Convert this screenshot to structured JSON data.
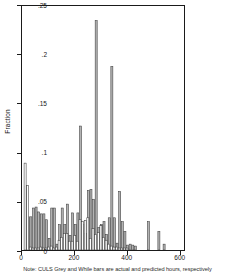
{
  "chart_data": {
    "type": "bar",
    "title": "",
    "subtitle": "",
    "xlabel": "",
    "ylabel": "Fraction",
    "xlim": [
      0,
      620
    ],
    "ylim": [
      0,
      0.25
    ],
    "grid": false,
    "legend_position": "none",
    "note": "Note: CULS Grey and While bars are actual  and predicted hours, respectively",
    "xticks": [
      0,
      200,
      400,
      600
    ],
    "xtick_labels": [
      "0",
      "200",
      "400",
      "600"
    ],
    "yticks": [
      0,
      0.05,
      0.1,
      0.15,
      0.2,
      0.25
    ],
    "ytick_labels": [
      "0",
      ".05",
      ".1",
      ".15",
      ".2",
      ".25"
    ],
    "bin_width": 10,
    "series": [
      {
        "name": "actual hours",
        "color": "#b3b3b3",
        "edge_color": "#3a3a3a",
        "x": [
          10,
          20,
          30,
          40,
          50,
          60,
          70,
          80,
          90,
          100,
          110,
          120,
          130,
          140,
          150,
          160,
          170,
          180,
          190,
          200,
          210,
          220,
          230,
          240,
          250,
          260,
          270,
          280,
          290,
          300,
          310,
          320,
          330,
          340,
          350,
          360,
          370,
          380,
          390,
          400,
          410,
          420,
          430,
          480,
          520,
          540
        ],
        "values": [
          0.065,
          0.034,
          0.034,
          0.043,
          0.044,
          0.039,
          0.037,
          0.037,
          0.031,
          0.012,
          0.043,
          0.043,
          0.006,
          0.026,
          0.043,
          0.026,
          0.047,
          0.015,
          0.038,
          0.026,
          0.038,
          0.127,
          0.026,
          0.017,
          0.061,
          0.062,
          0.052,
          0.235,
          0.023,
          0.026,
          0.029,
          0.016,
          0.033,
          0.188,
          0.033,
          0.007,
          0.06,
          0.029,
          0.019,
          0.005,
          0.006,
          0.005,
          0.004,
          0.029,
          0.019,
          0.006
        ]
      },
      {
        "name": "predicted hours",
        "color": "#ffffff",
        "edge_color": "#3a3a3a",
        "x": [
          8,
          18,
          28,
          38,
          48,
          58,
          68,
          78,
          88,
          98,
          108,
          118,
          128,
          138,
          148,
          158,
          168,
          178,
          188,
          198,
          208,
          218,
          228,
          238,
          248,
          258,
          268,
          278,
          288,
          298,
          308,
          318,
          328,
          338,
          348,
          358,
          368,
          378,
          388,
          398
        ],
        "values": [
          0.089,
          0.066,
          0.003,
          0.002,
          0.002,
          0.002,
          0.003,
          0.002,
          0.002,
          0.003,
          0.004,
          0.002,
          0.003,
          0.01,
          0.013,
          0.017,
          0.017,
          0.009,
          0.009,
          0.015,
          0.009,
          0.031,
          0.029,
          0.03,
          0.033,
          0.012,
          0.022,
          0.016,
          0.018,
          0.025,
          0.013,
          0.01,
          0.006,
          0.004,
          0.003,
          0.003,
          0.002,
          0.002,
          0.002,
          0.002
        ]
      }
    ]
  },
  "axes": {
    "ylabel_text": "Fraction"
  }
}
